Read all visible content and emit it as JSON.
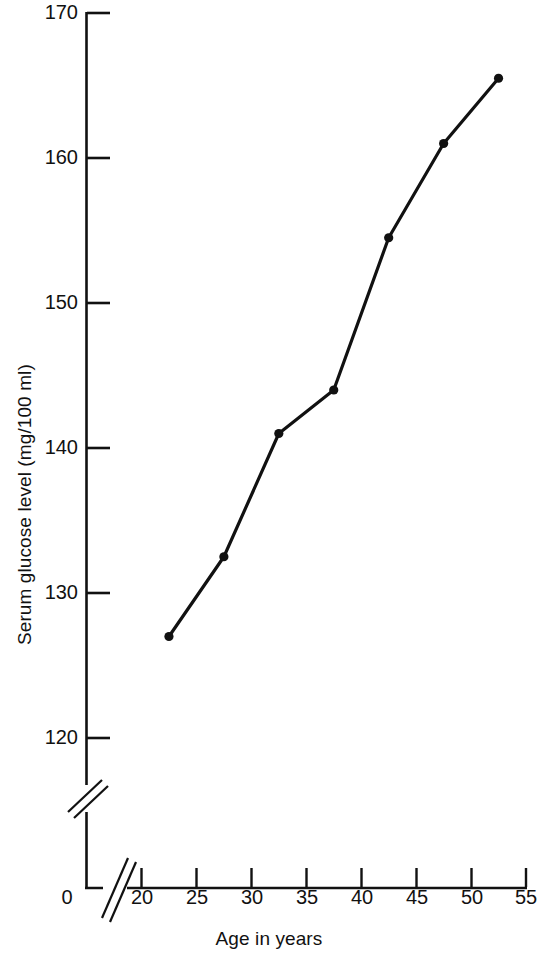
{
  "chart_data": {
    "type": "line",
    "title": "",
    "subtitle": "",
    "xlabel": "Age in years",
    "ylabel": "Serum glucose level (mg/100 ml)",
    "x": [
      22.5,
      27.5,
      32.5,
      37.5,
      42.5,
      47.5,
      52.5
    ],
    "values": [
      127,
      132.5,
      141,
      144,
      154.5,
      161,
      165.5
    ],
    "series": [
      {
        "name": "Serum glucose level",
        "x": [
          22.5,
          27.5,
          32.5,
          37.5,
          42.5,
          47.5,
          52.5
        ],
        "values": [
          127,
          132.5,
          141,
          144,
          154.5,
          161,
          165.5
        ]
      }
    ],
    "xlim": [
      20,
      55
    ],
    "ylim": [
      120,
      170
    ],
    "x_ticks": [
      20,
      25,
      30,
      35,
      40,
      45,
      50,
      55
    ],
    "x_tick_labels": [
      "20",
      "25",
      "30",
      "35",
      "40",
      "45",
      "50",
      "55"
    ],
    "y_ticks": [
      120,
      130,
      140,
      150,
      160,
      170
    ],
    "y_tick_labels": [
      "120",
      "130",
      "140",
      "150",
      "160",
      "170"
    ],
    "origin_label": "0",
    "grid": false,
    "legend": null,
    "axis_break": {
      "x_axis": true,
      "y_axis": true,
      "note": "double slash break marks near origin on both axes"
    },
    "marker": "filled-circle",
    "line_color": "#111111",
    "marker_color": "#111111",
    "background_color": "#ffffff"
  },
  "axes": {
    "y_title": "Serum glucose level (mg/100 ml)",
    "x_title": "Age in years",
    "origin": "0"
  },
  "y_tick_labels": [
    {
      "text": "170"
    },
    {
      "text": "160"
    },
    {
      "text": "150"
    },
    {
      "text": "140"
    },
    {
      "text": "130"
    },
    {
      "text": "120"
    }
  ],
  "x_tick_labels": [
    {
      "text": "20"
    },
    {
      "text": "25"
    },
    {
      "text": "30"
    },
    {
      "text": "35"
    },
    {
      "text": "40"
    },
    {
      "text": "45"
    },
    {
      "text": "50"
    },
    {
      "text": "55"
    }
  ]
}
